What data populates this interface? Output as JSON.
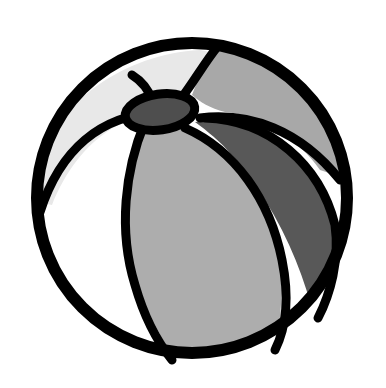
{
  "image": {
    "subject": "beach ball",
    "description": "Black-outlined clip-art beach ball with grayscale panels",
    "colors": {
      "background": "#ffffff",
      "outline": "#000000",
      "panel_white": "#ffffff",
      "panel_light": "#e6e6e6",
      "panel_mid": "#a9a9a9",
      "panel_dark": "#5a5a5a",
      "cap": "#4e4e4e"
    },
    "panels": [
      {
        "name": "upper-left",
        "shade": "light"
      },
      {
        "name": "upper-right",
        "shade": "mid"
      },
      {
        "name": "left",
        "shade": "white"
      },
      {
        "name": "center",
        "shade": "mid"
      },
      {
        "name": "right",
        "shade": "dark"
      }
    ]
  }
}
